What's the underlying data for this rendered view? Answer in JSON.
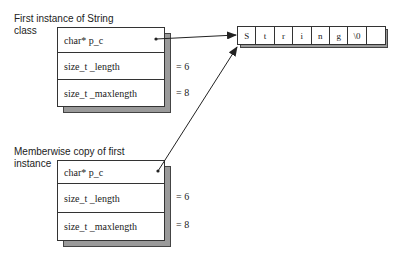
{
  "captions": {
    "first": [
      "First instance of String",
      "class"
    ],
    "copy": [
      "Memberwise copy of first",
      "instance"
    ]
  },
  "first_instance": {
    "fields": [
      {
        "label": "char*  p_c",
        "value": ""
      },
      {
        "label": "size_t  _length",
        "value": "=  6"
      },
      {
        "label": "size_t  _maxlength",
        "value": "=  8"
      }
    ]
  },
  "copy_instance": {
    "fields": [
      {
        "label": "char*  p_c",
        "value": ""
      },
      {
        "label": "size_t  _length",
        "value": "=  6"
      },
      {
        "label": "size_t  _maxlength",
        "value": "=  8"
      }
    ]
  },
  "string_buffer": {
    "cells": [
      "S",
      "t",
      "r",
      "i",
      "n",
      "g",
      "\\0",
      ""
    ]
  },
  "colors": {
    "line": "#222222",
    "shadow": "#9a9a9a"
  }
}
